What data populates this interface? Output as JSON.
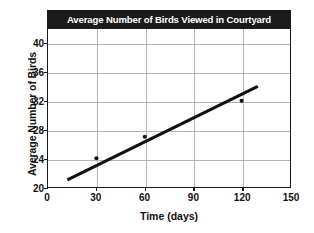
{
  "chart_data": {
    "type": "scatter",
    "title": "Average Number of Birds Viewed in Courtyard",
    "xlabel": "Time (days)",
    "ylabel": "Average Number of Birds",
    "xlim": [
      0,
      150
    ],
    "ylim": [
      20,
      42
    ],
    "xticks": [
      0,
      30,
      60,
      90,
      120,
      150
    ],
    "yticks": [
      20,
      24,
      28,
      32,
      36,
      40
    ],
    "grid": true,
    "legend": null,
    "series": [
      {
        "name": "Birds observed",
        "type": "scatter",
        "marker": "dot",
        "color": "#111111",
        "points": [
          {
            "x": 30,
            "y": 24
          },
          {
            "x": 60,
            "y": 27
          },
          {
            "x": 120,
            "y": 32
          }
        ]
      },
      {
        "name": "Trend line",
        "type": "line",
        "color": "#111111",
        "width": 3.2,
        "points": [
          {
            "x": 12,
            "y": 21
          },
          {
            "x": 130,
            "y": 34
          }
        ]
      }
    ]
  },
  "axes": {
    "y_tick_labels": [
      "40",
      "36",
      "32",
      "28",
      "24",
      "20"
    ],
    "x_tick_labels": [
      "0",
      "30",
      "60",
      "90",
      "120",
      "150"
    ]
  },
  "colors": {
    "title_bar_background": "#1a1a1a",
    "title_text": "#ffffff",
    "axis": "#1a1a1a",
    "grid": "#b4b4b4",
    "data": "#111111",
    "page_background": "#ffffff"
  }
}
